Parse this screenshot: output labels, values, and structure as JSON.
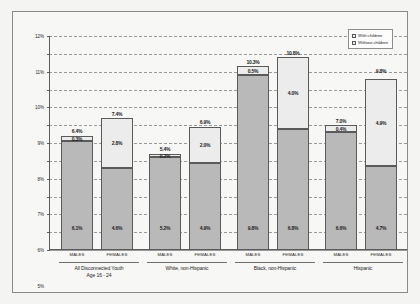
{
  "chart_data": {
    "type": "bar",
    "stacked": true,
    "title": "",
    "xlabel": "",
    "ylabel": "",
    "ylim": [
      0,
      12
    ],
    "ytick_labels": [
      "0%",
      "1%",
      "2%",
      "3%",
      "4%",
      "5%",
      "6%",
      "7%",
      "8%",
      "9%",
      "10%",
      "11%",
      "12%"
    ],
    "ytick_values": [
      0,
      1,
      2,
      3,
      4,
      5,
      6,
      7,
      8,
      9,
      10,
      11,
      12
    ],
    "grid": true,
    "legend_position": "top-right",
    "series": [
      {
        "name": "With children",
        "key": "with_children"
      },
      {
        "name": "Without children",
        "key": "without_children"
      }
    ],
    "groups": [
      {
        "name": "All Disconnected Youth\nAge 16 - 24",
        "bars": [
          {
            "sex": "MALES",
            "without_children": 6.1,
            "with_children": 0.3,
            "total": 6.4,
            "without_label": "6.1%",
            "with_label": "0.3%",
            "total_label": "6.4%"
          },
          {
            "sex": "FEMALES",
            "without_children": 4.6,
            "with_children": 2.8,
            "total": 7.4,
            "without_label": "4.6%",
            "with_label": "2.8%",
            "total_label": "7.4%"
          }
        ]
      },
      {
        "name": "White, non-Hispanic",
        "bars": [
          {
            "sex": "MALES",
            "without_children": 5.2,
            "with_children": 0.2,
            "total": 5.4,
            "without_label": "5.2%",
            "with_label": "0.2%",
            "total_label": "5.4%"
          },
          {
            "sex": "FEMALES",
            "without_children": 4.9,
            "with_children": 2.0,
            "total": 6.9,
            "without_label": "4.9%",
            "with_label": "2.0%",
            "total_label": "6.9%"
          }
        ]
      },
      {
        "name": "Black, non-Hispanic",
        "bars": [
          {
            "sex": "MALES",
            "without_children": 9.8,
            "with_children": 0.5,
            "total": 10.3,
            "without_label": "9.8%",
            "with_label": "0.5%",
            "total_label": "10.3%"
          },
          {
            "sex": "FEMALES",
            "without_children": 6.8,
            "with_children": 4.0,
            "total": 10.8,
            "without_label": "6.8%",
            "with_label": "4.0%",
            "total_label": "10.8%"
          }
        ]
      },
      {
        "name": "Hispanic",
        "bars": [
          {
            "sex": "MALES",
            "without_children": 6.6,
            "with_children": 0.4,
            "total": 7.0,
            "without_label": "6.6%",
            "with_label": "0.4%",
            "total_label": "7.0%"
          },
          {
            "sex": "FEMALES",
            "without_children": 4.7,
            "with_children": 4.9,
            "total": 9.8,
            "without_label": "4.7%",
            "with_label": "4.9%",
            "total_label": "9.8%"
          }
        ]
      }
    ],
    "colors": {
      "with_children_fill": "#ececec",
      "without_children_fill": "#b9b9b9",
      "bar_border": "#5a5a5a",
      "gridline": "#9a9a9a",
      "axis": "#5d5d5d",
      "plot_background": "#f7f7f5",
      "page_background": "#f4f4f2"
    }
  }
}
